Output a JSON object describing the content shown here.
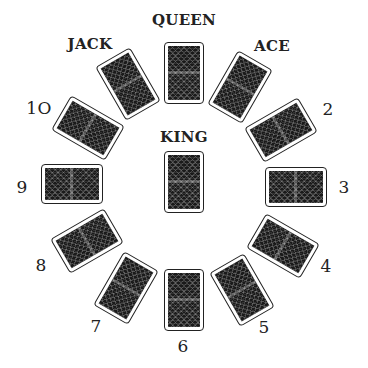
{
  "colors": {
    "card_back": "#1a1a1a",
    "card_border": "#222222",
    "background": "#ffffff"
  },
  "positions": [
    {
      "id": "queen",
      "label": "QUEEN",
      "label_pos": [
        184,
        20
      ],
      "card_center": [
        184,
        73
      ],
      "rotation": 0,
      "orientation": "portrait"
    },
    {
      "id": "ace",
      "label": "ACE",
      "label_pos": [
        272,
        46
      ],
      "card_center": [
        240,
        87
      ],
      "rotation": 30,
      "orientation": "portrait"
    },
    {
      "id": "two",
      "label": "2",
      "label_pos": [
        328,
        109
      ],
      "card_center": [
        281,
        130
      ],
      "rotation": -30,
      "orientation": "landscape"
    },
    {
      "id": "three",
      "label": "3",
      "label_pos": [
        344,
        187
      ],
      "card_center": [
        296,
        187
      ],
      "rotation": 0,
      "orientation": "landscape"
    },
    {
      "id": "four",
      "label": "4",
      "label_pos": [
        326,
        266
      ],
      "card_center": [
        283,
        246
      ],
      "rotation": 30,
      "orientation": "landscape"
    },
    {
      "id": "five",
      "label": "5",
      "label_pos": [
        264,
        327
      ],
      "card_center": [
        242,
        290
      ],
      "rotation": -30,
      "orientation": "portrait"
    },
    {
      "id": "six",
      "label": "6",
      "label_pos": [
        183,
        346
      ],
      "card_center": [
        184,
        300
      ],
      "rotation": 0,
      "orientation": "portrait"
    },
    {
      "id": "seven",
      "label": "7",
      "label_pos": [
        96,
        326
      ],
      "card_center": [
        126,
        288
      ],
      "rotation": 30,
      "orientation": "portrait"
    },
    {
      "id": "eight",
      "label": "8",
      "label_pos": [
        41,
        265
      ],
      "card_center": [
        87,
        241
      ],
      "rotation": -30,
      "orientation": "landscape"
    },
    {
      "id": "nine",
      "label": "9",
      "label_pos": [
        22,
        187
      ],
      "card_center": [
        72,
        184
      ],
      "rotation": 0,
      "orientation": "landscape"
    },
    {
      "id": "ten",
      "label": "1O",
      "label_pos": [
        39,
        108
      ],
      "card_center": [
        88,
        128
      ],
      "rotation": 30,
      "orientation": "landscape"
    },
    {
      "id": "jack",
      "label": "JACK",
      "label_pos": [
        90,
        44
      ],
      "card_center": [
        128,
        84
      ],
      "rotation": -30,
      "orientation": "portrait"
    },
    {
      "id": "king",
      "label": "KING",
      "label_pos": [
        184,
        137
      ],
      "card_center": [
        184,
        182
      ],
      "rotation": 0,
      "orientation": "portrait"
    }
  ]
}
